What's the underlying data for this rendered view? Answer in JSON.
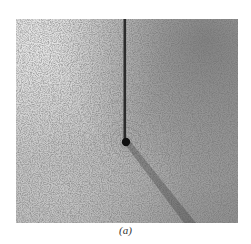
{
  "figure": {
    "caption": "(a)",
    "colors": {
      "background": "#ffffff",
      "filings_light": "#d9d9d9",
      "filings_dark": "#8f8f8f",
      "wire": "#2a2a2a"
    }
  }
}
